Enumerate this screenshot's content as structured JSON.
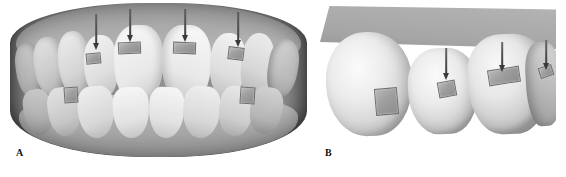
{
  "figure": {
    "kind": "dental-orthodontic-figure",
    "background_color": "#ffffff",
    "width": 566,
    "height": 177,
    "panel_count": 2
  },
  "panels": [
    {
      "id": "A",
      "caption": "A",
      "caption_position": {
        "x": 16,
        "y": 152
      },
      "view": "frontal full-arch intraoral scan (upper and lower dentition in occlusion)",
      "bounds": {
        "x": 10,
        "y": 3,
        "width": 297,
        "height": 154
      },
      "arrows": [
        {
          "index": 1,
          "label": "arrow-1",
          "x": 93,
          "y": 14,
          "length": 32,
          "angle_deg": 0,
          "points_to": "upper-right-lateral-incisor-attachment"
        },
        {
          "index": 2,
          "label": "arrow-2",
          "x": 127,
          "y": 9,
          "length": 30,
          "angle_deg": 0,
          "points_to": "upper-right-central-incisor-attachment"
        },
        {
          "index": 3,
          "label": "arrow-3",
          "x": 182,
          "y": 9,
          "length": 30,
          "angle_deg": 0,
          "points_to": "upper-left-central-incisor-attachment"
        },
        {
          "index": 4,
          "label": "arrow-4",
          "x": 235,
          "y": 12,
          "length": 31,
          "angle_deg": 0,
          "points_to": "upper-left-lateral-incisor-attachment"
        }
      ],
      "attachments": [
        {
          "label": "attachment-upper-right-lateral",
          "x": 86,
          "y": 53,
          "width": 15,
          "height": 11,
          "tilt_deg": -6
        },
        {
          "label": "attachment-upper-right-central",
          "x": 118,
          "y": 42,
          "width": 23,
          "height": 12,
          "tilt_deg": -3
        },
        {
          "label": "attachment-upper-left-central",
          "x": 173,
          "y": 42,
          "width": 23,
          "height": 12,
          "tilt_deg": 2
        },
        {
          "label": "attachment-upper-left-lateral",
          "x": 228,
          "y": 47,
          "width": 16,
          "height": 13,
          "tilt_deg": 7
        },
        {
          "label": "attachment-lower-right-premolar",
          "x": 64,
          "y": 87,
          "width": 14,
          "height": 16,
          "tilt_deg": -4
        },
        {
          "label": "attachment-lower-left-premolar",
          "x": 240,
          "y": 87,
          "width": 15,
          "height": 17,
          "tilt_deg": 4
        }
      ]
    },
    {
      "id": "B",
      "caption": "B",
      "caption_position": {
        "x": 325,
        "y": 152
      },
      "view": "buccal close-up of posterior segment with bonded attachments",
      "bounds": {
        "x": 320,
        "y": 6,
        "width": 236,
        "height": 140
      },
      "arrows": [
        {
          "index": 1,
          "label": "arrow-1",
          "x": 446,
          "y": 48,
          "length": 28,
          "angle_deg": 0,
          "points_to": "mid-tooth-attachment"
        },
        {
          "index": 2,
          "label": "arrow-2",
          "x": 502,
          "y": 42,
          "length": 27,
          "angle_deg": 0,
          "points_to": "distal-tooth-attachment"
        },
        {
          "index": 3,
          "label": "arrow-3",
          "x": 546,
          "y": 40,
          "length": 28,
          "angle_deg": 0,
          "points_to": "terminal-tooth-attachment"
        }
      ],
      "attachments": [
        {
          "label": "attachment-mesial-large",
          "x": 375,
          "y": 88,
          "width": 23,
          "height": 27,
          "tilt_deg": -5
        },
        {
          "label": "attachment-middle",
          "x": 438,
          "y": 81,
          "width": 18,
          "height": 16,
          "tilt_deg": -10
        },
        {
          "label": "attachment-distal-wide",
          "x": 488,
          "y": 68,
          "width": 32,
          "height": 16,
          "tilt_deg": -9
        },
        {
          "label": "attachment-terminal-small",
          "x": 539,
          "y": 66,
          "width": 14,
          "height": 11,
          "tilt_deg": -18
        }
      ]
    }
  ],
  "palette": {
    "background": "#ffffff",
    "tooth_light": "#f2f2f2",
    "tooth_shadow": "#c9c9c9",
    "gingiva_mid": "#ababab",
    "gingiva_dark": "#8c8c8c",
    "bracket_fill": "#9e9e9e",
    "bracket_edge": "#6f6f6f",
    "arrow": "#3a3a3a",
    "caption_text": "#111111"
  }
}
